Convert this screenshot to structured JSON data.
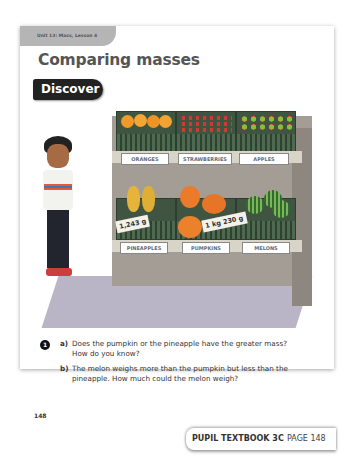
{
  "page": {
    "unit_label": "Unit 13: Mass, Lesson 4",
    "title": "Comparing masses",
    "section_badge": "Discover",
    "page_number": "148"
  },
  "illustration": {
    "top_shelf_labels": [
      "ORANGES",
      "STRAWBERRIES",
      "APPLES"
    ],
    "bottom_shelf_labels": [
      "PINEAPPLES",
      "PUMPKINS",
      "MELONS"
    ],
    "price_tags": {
      "pineapple": "1,243 g",
      "pumpkin": "1 kg 230 g"
    }
  },
  "question": {
    "number": "1",
    "parts": [
      {
        "letter": "a)",
        "text_line1": "Does the pumpkin or the pineapple have the greater mass?",
        "text_line2": "How do you know?"
      },
      {
        "letter": "b)",
        "text_line1": "The melon weighs more than the pumpkin but less than the",
        "text_line2": "pineapple. How much could the melon weigh?"
      }
    ]
  },
  "footer": {
    "book": "PUPIL TEXTBOOK 3C",
    "page_label": "PAGE 148"
  },
  "colors": {
    "badge": "#222222",
    "unit_tab": "#b5b5b5",
    "crate": "#3f5542",
    "stand": "#a39d95"
  }
}
